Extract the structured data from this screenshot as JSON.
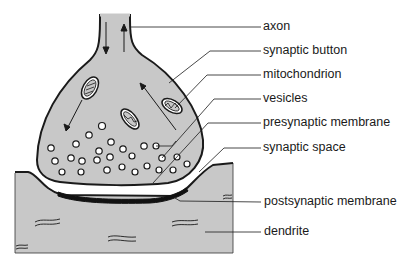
{
  "diagram": {
    "colors": {
      "fill": "#c8c8c8",
      "outline": "#1a1a1a",
      "background": "#ffffff",
      "text": "#1a1a1a"
    },
    "labels": [
      {
        "id": "axon",
        "text": "axon",
        "x": 263,
        "y": 18
      },
      {
        "id": "synaptic-button",
        "text": "synaptic button",
        "x": 263,
        "y": 42
      },
      {
        "id": "mitochondrion",
        "text": "mitochondrion",
        "x": 263,
        "y": 66
      },
      {
        "id": "vesicles",
        "text": "vesicles",
        "x": 263,
        "y": 90
      },
      {
        "id": "presynaptic-membrane",
        "text": "presynaptic membrane",
        "x": 263,
        "y": 114
      },
      {
        "id": "synaptic-space",
        "text": "synaptic space",
        "x": 263,
        "y": 139
      },
      {
        "id": "postsynaptic-membrane",
        "text": "postsynaptic membrane",
        "x": 264,
        "y": 193
      },
      {
        "id": "dendrite",
        "text": "dendrite",
        "x": 264,
        "y": 223
      }
    ]
  }
}
